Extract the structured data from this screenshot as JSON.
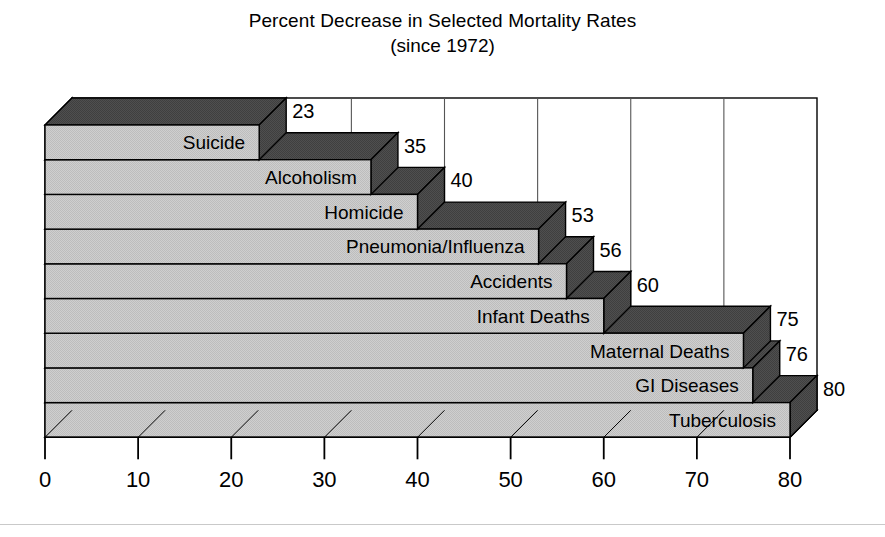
{
  "chart_data": {
    "type": "bar",
    "orientation": "horizontal",
    "title": "Percent Decrease in Selected Mortality Rates",
    "subtitle": "(since 1972)",
    "xlabel": "",
    "ylabel": "",
    "xlim": [
      0,
      80
    ],
    "xticks": [
      "0",
      "10",
      "20",
      "30",
      "40",
      "50",
      "60",
      "70",
      "80"
    ],
    "grid": "vertical",
    "legend": "none",
    "style": "3d-stepped",
    "categories": [
      "Suicide",
      "Alcoholism",
      "Homicide",
      "Pneumonia/Influenza",
      "Accidents",
      "Infant Deaths",
      "Maternal Deaths",
      "GI Diseases",
      "Tuberculosis"
    ],
    "values": [
      23,
      35,
      40,
      53,
      56,
      60,
      75,
      76,
      80
    ],
    "value_labels": [
      "23",
      "35",
      "40",
      "53",
      "56",
      "60",
      "75",
      "76",
      "80"
    ],
    "colors": {
      "bar_face": "#c6c6c6",
      "bar_top": "#4a4a4a",
      "bar_side": "#4a4a4a",
      "outline": "#000000",
      "grid": "#555555",
      "background": "#ffffff",
      "floor": "#f2f2f2",
      "wall_side": "#dcdcdc"
    }
  },
  "bottom_rule": ""
}
